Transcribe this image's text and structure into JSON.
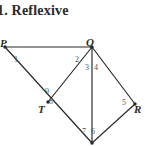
{
  "title": {
    "text": "1. Reflexive"
  },
  "figure": {
    "stroke_color": "#262626",
    "label_color": "#2b2b2b",
    "angle_label_color": "#555555",
    "background": "#ffffff",
    "vertices": [
      {
        "name": "P",
        "label": "P",
        "x": 5,
        "y": 23
      },
      {
        "name": "Q",
        "label": "Q",
        "x": 92,
        "y": 23
      },
      {
        "name": "T",
        "label": "T",
        "x": 48,
        "y": 78
      },
      {
        "name": "R",
        "label": "R",
        "x": 135,
        "y": 80
      },
      {
        "name": "S",
        "label": "",
        "x": 92,
        "y": 119
      }
    ],
    "segments": [
      {
        "name": "P-Q",
        "from": "P",
        "to": "Q"
      },
      {
        "name": "P-S",
        "from": "P",
        "to": "S"
      },
      {
        "name": "Q-T",
        "from": "Q",
        "to": "T"
      },
      {
        "name": "Q-S",
        "from": "Q",
        "to": "S"
      },
      {
        "name": "Q-R",
        "from": "Q",
        "to": "R"
      },
      {
        "name": "R-S",
        "from": "R",
        "to": "S"
      }
    ],
    "vertex_labels": [
      {
        "name": "vertex-label-p",
        "text": "P",
        "x": 0,
        "y": 13
      },
      {
        "name": "vertex-label-q",
        "text": "Q",
        "x": 86,
        "y": 12
      },
      {
        "name": "vertex-label-t",
        "text": "T",
        "x": 38,
        "y": 79
      },
      {
        "name": "vertex-label-r",
        "text": "R",
        "x": 134,
        "y": 79
      }
    ],
    "angle_labels": [
      {
        "name": "angle-1",
        "text": "1",
        "x": 14,
        "y": 31
      },
      {
        "name": "angle-2",
        "text": "2",
        "x": 75,
        "y": 31
      },
      {
        "name": "angle-3",
        "text": "3",
        "x": 85,
        "y": 39
      },
      {
        "name": "angle-4",
        "text": "4",
        "x": 94,
        "y": 39
      },
      {
        "name": "angle-5",
        "text": "5",
        "x": 122,
        "y": 74
      },
      {
        "name": "angle-6",
        "text": "6",
        "x": 91,
        "y": 103
      },
      {
        "name": "angle-7",
        "text": "7",
        "x": 82,
        "y": 103
      },
      {
        "name": "angle-8",
        "text": "8",
        "x": 49,
        "y": 73
      },
      {
        "name": "angle-9",
        "text": "9",
        "x": 45,
        "y": 63
      }
    ]
  }
}
